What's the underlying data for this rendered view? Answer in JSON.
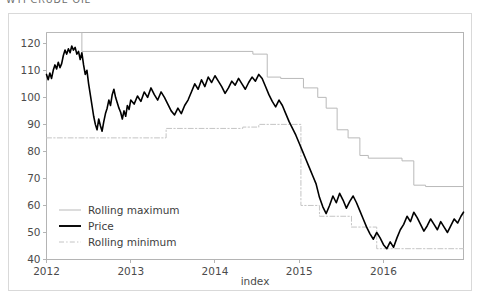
{
  "page": {
    "title": "WTI CRUDE OIL",
    "background_color": "#ffffff",
    "card_border_color": "#d9d9d9"
  },
  "chart_data": {
    "type": "line",
    "title": "WTI CRUDE OIL",
    "xlabel": "index",
    "ylabel": "",
    "xlim": [
      2012.0,
      2016.95
    ],
    "ylim": [
      40,
      124
    ],
    "grid": false,
    "legend_position": "lower left",
    "xtick_labels": [
      "2012",
      "2013",
      "2014",
      "2015",
      "2016"
    ],
    "xtick_values": [
      2012,
      2013,
      2014,
      2015,
      2016
    ],
    "ytick_labels": [
      "40",
      "50",
      "60",
      "70",
      "80",
      "90",
      "100",
      "110",
      "120"
    ],
    "ytick_values": [
      40,
      50,
      60,
      70,
      80,
      90,
      100,
      110,
      120
    ],
    "colors": {
      "price": "#000000",
      "rolling_maximum": "#b9b9b9",
      "rolling_minimum": "#c4c4c4"
    },
    "series": [
      {
        "name": "Rolling maximum",
        "style": "solid",
        "color": "#b9b9b9",
        "width": 1,
        "x": [
          2012.0,
          2012.42,
          2012.42,
          2014.45,
          2014.45,
          2014.62,
          2014.62,
          2014.78,
          2014.78,
          2015.05,
          2015.05,
          2015.22,
          2015.22,
          2015.32,
          2015.32,
          2015.45,
          2015.45,
          2015.58,
          2015.58,
          2015.72,
          2015.72,
          2015.82,
          2015.82,
          2016.22,
          2016.22,
          2016.36,
          2016.36,
          2016.5,
          2016.5,
          2016.95
        ],
        "y": [
          124.0,
          124.0,
          117.0,
          117.0,
          116.0,
          116.0,
          107.5,
          107.5,
          107.0,
          107.0,
          103.5,
          103.5,
          100.0,
          100.0,
          96.0,
          96.0,
          88.0,
          88.0,
          85.0,
          85.0,
          78.5,
          78.5,
          77.5,
          77.5,
          76.5,
          76.5,
          67.5,
          67.5,
          67.0,
          67.0
        ]
      },
      {
        "name": "Rolling minimum",
        "style": "dashdot",
        "color": "#c4c4c4",
        "width": 1,
        "x": [
          2012.0,
          2013.42,
          2013.42,
          2014.33,
          2014.33,
          2014.52,
          2014.52,
          2015.02,
          2015.02,
          2015.24,
          2015.24,
          2015.62,
          2015.62,
          2015.92,
          2015.92,
          2016.95
        ],
        "y": [
          85.0,
          85.0,
          88.5,
          88.5,
          89.0,
          89.0,
          90.0,
          90.0,
          60.0,
          60.0,
          56.0,
          56.0,
          52.0,
          52.0,
          44.0,
          44.0
        ]
      },
      {
        "name": "Price",
        "style": "solid",
        "color": "#000000",
        "width": 1.6,
        "x": [
          2012.0,
          2012.02,
          2012.04,
          2012.06,
          2012.08,
          2012.1,
          2012.12,
          2012.14,
          2012.16,
          2012.18,
          2012.2,
          2012.22,
          2012.24,
          2012.26,
          2012.28,
          2012.3,
          2012.32,
          2012.34,
          2012.36,
          2012.38,
          2012.4,
          2012.42,
          2012.44,
          2012.46,
          2012.48,
          2012.5,
          2012.52,
          2012.54,
          2012.56,
          2012.58,
          2012.6,
          2012.62,
          2012.64,
          2012.66,
          2012.68,
          2012.7,
          2012.72,
          2012.74,
          2012.76,
          2012.78,
          2012.8,
          2012.82,
          2012.84,
          2012.86,
          2012.88,
          2012.9,
          2012.92,
          2012.94,
          2012.96,
          2012.98,
          2013.0,
          2013.04,
          2013.08,
          2013.12,
          2013.16,
          2013.2,
          2013.24,
          2013.28,
          2013.32,
          2013.36,
          2013.4,
          2013.44,
          2013.48,
          2013.52,
          2013.56,
          2013.6,
          2013.64,
          2013.68,
          2013.72,
          2013.76,
          2013.8,
          2013.84,
          2013.88,
          2013.92,
          2013.96,
          2014.0,
          2014.04,
          2014.08,
          2014.12,
          2014.16,
          2014.2,
          2014.24,
          2014.28,
          2014.32,
          2014.36,
          2014.4,
          2014.44,
          2014.48,
          2014.52,
          2014.56,
          2014.6,
          2014.64,
          2014.68,
          2014.72,
          2014.76,
          2014.8,
          2014.84,
          2014.88,
          2014.92,
          2014.96,
          2015.0,
          2015.04,
          2015.08,
          2015.12,
          2015.16,
          2015.2,
          2015.24,
          2015.28,
          2015.32,
          2015.36,
          2015.4,
          2015.44,
          2015.48,
          2015.52,
          2015.56,
          2015.6,
          2015.64,
          2015.68,
          2015.72,
          2015.76,
          2015.8,
          2015.84,
          2015.88,
          2015.92,
          2015.96,
          2016.0,
          2016.04,
          2016.08,
          2016.12,
          2016.16,
          2016.2,
          2016.24,
          2016.28,
          2016.32,
          2016.36,
          2016.4,
          2016.44,
          2016.48,
          2016.52,
          2016.56,
          2016.6,
          2016.64,
          2016.68,
          2016.72,
          2016.76,
          2016.8,
          2016.84,
          2016.88,
          2016.92,
          2016.95
        ],
        "y": [
          108.5,
          106.5,
          109.0,
          107.0,
          110.0,
          112.0,
          110.5,
          113.0,
          111.0,
          112.5,
          115.5,
          117.5,
          116.0,
          118.0,
          116.5,
          119.0,
          117.5,
          118.5,
          116.0,
          117.0,
          114.0,
          116.5,
          112.0,
          108.5,
          110.0,
          105.0,
          101.0,
          97.0,
          93.0,
          90.0,
          88.0,
          92.0,
          89.5,
          87.5,
          91.0,
          94.0,
          96.0,
          99.0,
          97.0,
          101.0,
          103.0,
          100.0,
          98.0,
          96.0,
          94.5,
          92.0,
          95.0,
          93.0,
          97.0,
          95.5,
          99.0,
          97.5,
          100.5,
          98.5,
          102.0,
          100.0,
          103.5,
          101.0,
          99.0,
          102.0,
          100.0,
          97.5,
          95.0,
          93.5,
          96.0,
          94.0,
          97.0,
          99.0,
          102.0,
          105.0,
          103.0,
          106.5,
          104.0,
          107.5,
          105.5,
          108.0,
          106.0,
          104.0,
          101.5,
          103.5,
          106.0,
          104.5,
          107.0,
          105.0,
          103.0,
          105.5,
          107.5,
          106.0,
          108.5,
          107.0,
          104.0,
          101.0,
          98.5,
          96.5,
          99.0,
          97.0,
          94.0,
          91.0,
          88.5,
          86.0,
          83.0,
          80.0,
          77.0,
          74.0,
          71.0,
          68.0,
          63.0,
          59.5,
          57.0,
          60.0,
          63.5,
          61.0,
          64.5,
          62.0,
          59.0,
          61.5,
          63.5,
          61.0,
          58.0,
          55.0,
          52.0,
          49.5,
          47.5,
          50.0,
          48.0,
          45.5,
          44.0,
          46.5,
          44.5,
          48.0,
          51.0,
          53.0,
          56.0,
          54.0,
          57.5,
          55.5,
          53.0,
          50.5,
          52.5,
          55.0,
          53.0,
          51.0,
          54.0,
          52.0,
          50.0,
          52.5,
          55.0,
          53.5,
          56.0,
          57.5
        ]
      }
    ]
  },
  "legend": {
    "items": [
      {
        "label": "Rolling maximum",
        "style": "solid-thin",
        "color": "#b9b9b9"
      },
      {
        "label": "Price",
        "style": "solid-thick",
        "color": "#000000"
      },
      {
        "label": "Rolling minimum",
        "style": "dashdot",
        "color": "#c4c4c4"
      }
    ]
  },
  "axes": {
    "x_title": "index",
    "y_title": ""
  }
}
